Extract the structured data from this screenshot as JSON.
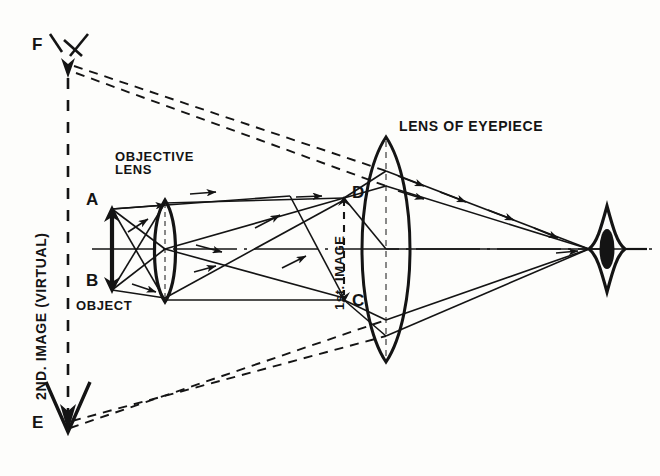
{
  "figure": {
    "type": "optical-ray-diagram",
    "background_color": "#fdfdfb",
    "ink_color": "#141414"
  },
  "labels": {
    "second_image": "2ND. IMAGE (VIRTUAL)",
    "objective_lens": "OBJECTIVE\nLENS",
    "object": "OBJECT",
    "first_image": "1st. IMAGE",
    "lens_of_eyepiece": "LENS OF EYEPIECE",
    "point_a": "A",
    "point_b": "B",
    "point_c": "C",
    "point_d": "D",
    "point_e": "E",
    "point_f": "F"
  },
  "optics": {
    "axis_y": 249,
    "objective_lens": {
      "center_x": 165,
      "top_y": 200,
      "bottom_y": 302,
      "half_width": 13
    },
    "eyepiece_lens": {
      "center_x": 386,
      "top_y": 137,
      "bottom_y": 362,
      "half_width": 30
    },
    "object": {
      "x": 112,
      "top_y": 207,
      "bottom_y": 292,
      "top_point": "A",
      "bottom_point": "B"
    },
    "first_image": {
      "x": 344,
      "top_y": 196,
      "bottom_y": 300,
      "top_point": "D",
      "bottom_point": "C"
    },
    "second_image": {
      "x": 68,
      "top_y": 70,
      "bottom_y": 432,
      "top_point": "F",
      "bottom_point": "E",
      "nature": "VIRTUAL"
    },
    "eye": {
      "center_x": 607,
      "center_y": 249
    },
    "ray_convergence_x": 589
  }
}
